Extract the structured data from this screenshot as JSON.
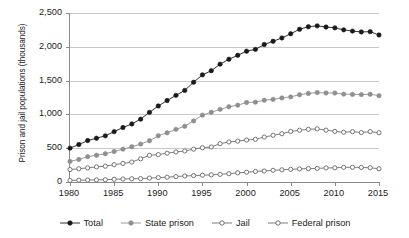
{
  "chart_data": {
    "type": "line",
    "title": "",
    "xlabel": "",
    "ylabel": "Prison and jail populations (thousands)",
    "xlim": [
      1980,
      2015
    ],
    "ylim": [
      0,
      2500
    ],
    "xticks": [
      "1980",
      "1985",
      "1990",
      "1995",
      "2000",
      "2005",
      "2010",
      "2015"
    ],
    "xtick_values": [
      1980,
      1985,
      1990,
      1995,
      2000,
      2005,
      2010,
      2015
    ],
    "yticks": [
      "0",
      "500",
      "1,000",
      "1,500",
      "2,000",
      "2,500"
    ],
    "ytick_values": [
      0,
      500,
      1000,
      1500,
      2000,
      2500
    ],
    "grid": "horizontal",
    "legend_position": "bottom",
    "x": [
      1980,
      1981,
      1982,
      1983,
      1984,
      1985,
      1986,
      1987,
      1988,
      1989,
      1990,
      1991,
      1992,
      1993,
      1994,
      1995,
      1996,
      1997,
      1998,
      1999,
      2000,
      2001,
      2002,
      2003,
      2004,
      2005,
      2006,
      2007,
      2008,
      2009,
      2010,
      2011,
      2012,
      2013,
      2014,
      2015
    ],
    "series": [
      {
        "name": "Total",
        "color": "#1a1a1a",
        "marker": "filled-circle",
        "values": [
          501,
          554,
          613,
          648,
          683,
          745,
          806,
          859,
          930,
          1030,
          1125,
          1205,
          1282,
          1355,
          1476,
          1585,
          1646,
          1743,
          1816,
          1874,
          1935,
          1962,
          2033,
          2082,
          2131,
          2193,
          2259,
          2297,
          2310,
          2292,
          2280,
          2251,
          2232,
          2220,
          2224,
          2175
        ]
      },
      {
        "name": "State prison",
        "color": "#8f8f8f",
        "marker": "filled-circle",
        "values": [
          305,
          334,
          375,
          395,
          418,
          451,
          486,
          521,
          561,
          610,
          684,
          728,
          779,
          825,
          904,
          989,
          1032,
          1075,
          1113,
          1137,
          1176,
          1181,
          1210,
          1222,
          1244,
          1259,
          1291,
          1310,
          1323,
          1317,
          1316,
          1300,
          1296,
          1293,
          1298,
          1277
        ]
      },
      {
        "name": "Jail",
        "color": "#6e6e6e",
        "marker": "open-circle",
        "values": [
          184,
          196,
          209,
          224,
          234,
          256,
          274,
          295,
          343,
          395,
          405,
          426,
          445,
          459,
          486,
          507,
          518,
          567,
          592,
          605,
          621,
          631,
          665,
          691,
          714,
          747,
          766,
          780,
          786,
          767,
          749,
          736,
          745,
          731,
          745,
          728
        ]
      },
      {
        "name": "Federal prison",
        "color": "#6e6e6e",
        "marker": "open-circle",
        "values": [
          24,
          27,
          29,
          31,
          34,
          40,
          44,
          48,
          50,
          58,
          65,
          71,
          80,
          89,
          95,
          100,
          106,
          113,
          123,
          135,
          145,
          156,
          163,
          173,
          180,
          187,
          193,
          199,
          201,
          208,
          210,
          217,
          218,
          215,
          211,
          196
        ]
      }
    ]
  },
  "legend": {
    "items": [
      {
        "label": "Total"
      },
      {
        "label": "State prison"
      },
      {
        "label": "Jail"
      },
      {
        "label": "Federal prison"
      }
    ]
  }
}
